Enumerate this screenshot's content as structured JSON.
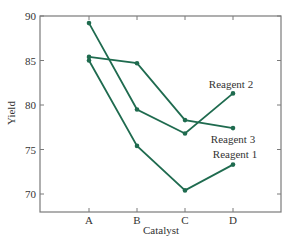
{
  "chart_data": {
    "type": "line",
    "title": "",
    "xlabel": "Catalyst",
    "ylabel": "Yield",
    "categories": [
      "A",
      "B",
      "C",
      "D"
    ],
    "ylim": [
      68,
      90
    ],
    "yticks": [
      70,
      75,
      80,
      85,
      90
    ],
    "grid": false,
    "legend_position": "inline labels at right end of lines",
    "line_color": "#1f6b4f",
    "series": [
      {
        "name": "Reagent 1",
        "values": [
          85.0,
          75.4,
          70.4,
          73.3
        ]
      },
      {
        "name": "Reagent 2",
        "values": [
          89.2,
          79.5,
          76.8,
          81.3
        ]
      },
      {
        "name": "Reagent 3",
        "values": [
          85.4,
          84.7,
          78.3,
          77.4
        ]
      }
    ],
    "annotations": [
      {
        "text": "Reagent 2",
        "series": "Reagent 2"
      },
      {
        "text": "Reagent 3",
        "series": "Reagent 3"
      },
      {
        "text": "Reagent 1",
        "series": "Reagent 1"
      }
    ]
  }
}
